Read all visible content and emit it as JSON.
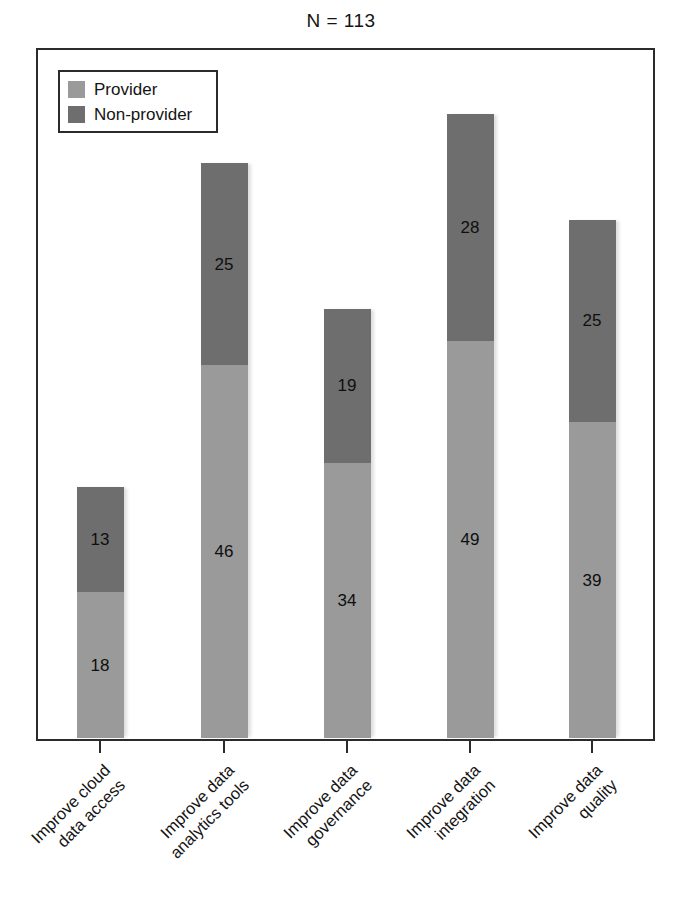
{
  "chart_data": {
    "type": "bar",
    "subtype": "stacked-vertical",
    "title": "N = 113",
    "xlabel": "",
    "ylabel": "",
    "ylim": [
      0,
      85
    ],
    "grid": false,
    "axis_tick_labels_y": [],
    "legend_position": "top-left-inside",
    "categories": [
      "Improve cloud data access",
      "Improve data analytics tools",
      "Improve data governance",
      "Improve data integration",
      "Improve data quality"
    ],
    "category_label_lines": [
      [
        "Improve cloud",
        "data access"
      ],
      [
        "Improve data",
        "analytics tools"
      ],
      [
        "Improve data",
        "governance"
      ],
      [
        "Improve data",
        "integration"
      ],
      [
        "Improve data",
        "quality"
      ]
    ],
    "series": [
      {
        "name": "Provider",
        "color": "#9a9a9a",
        "values": [
          18,
          46,
          34,
          49,
          39
        ]
      },
      {
        "name": "Non-provider",
        "color": "#6e6e6e",
        "values": [
          13,
          25,
          19,
          28,
          25
        ]
      }
    ],
    "stack_totals": [
      31,
      71,
      53,
      77,
      64
    ],
    "value_labels_shown": true
  },
  "legend": {
    "items": [
      {
        "label": "Provider",
        "swatch_class": "provider"
      },
      {
        "label": "Non-provider",
        "swatch_class": "nonprovider"
      }
    ]
  },
  "colors": {
    "provider": "#9a9a9a",
    "non_provider": "#6e6e6e",
    "frame": "#2b2b2b",
    "background": "#ffffff",
    "text": "#141414"
  }
}
